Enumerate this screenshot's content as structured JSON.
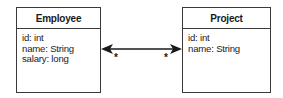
{
  "diagram": {
    "type": "uml-class-diagram",
    "entities": [
      {
        "name": "Employee",
        "attributes": [
          "id: int",
          "name: String",
          "salary: long"
        ]
      },
      {
        "name": "Project",
        "attributes": [
          "id: int",
          "name: String"
        ]
      }
    ],
    "association": {
      "from": "Employee",
      "to": "Project",
      "navigability": "bidirectional",
      "source_multiplicity": "*",
      "target_multiplicity": "*"
    },
    "colors": {
      "line": "#1a1a1a",
      "border": "#3a3a3a",
      "background": "#ffffff"
    }
  }
}
